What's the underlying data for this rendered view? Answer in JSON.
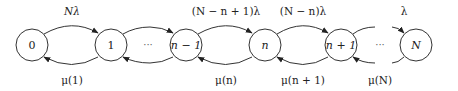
{
  "diagram": {
    "type": "birth-death state transition diagram",
    "nodes": [
      {
        "id": "0",
        "label": "0",
        "cx": 32,
        "italic": false
      },
      {
        "id": "1",
        "label": "1",
        "cx": 111,
        "italic": false
      },
      {
        "id": "n-1",
        "label": "n − 1",
        "cx": 186,
        "italic": true
      },
      {
        "id": "n",
        "label": "n",
        "cx": 265,
        "italic": true
      },
      {
        "id": "n+1",
        "label": "n + 1",
        "cx": 341,
        "italic": true
      },
      {
        "id": "N",
        "label": "N",
        "cx": 416,
        "italic": true
      }
    ],
    "ellipses": [
      {
        "text": "···",
        "x": 148
      },
      {
        "text": "···",
        "x": 380
      }
    ],
    "forward_labels": [
      {
        "text": "Nλ",
        "x": 72
      },
      {
        "text": "(N − n + 1)λ",
        "x": 226
      },
      {
        "text": "(N − n)λ",
        "x": 303
      },
      {
        "text": "λ",
        "x": 404
      }
    ],
    "backward_labels": [
      {
        "text": "μ(1)",
        "x": 72
      },
      {
        "text": "μ(n)",
        "x": 226
      },
      {
        "text": "μ(n + 1)",
        "x": 303
      },
      {
        "text": "μ(N)",
        "x": 380
      }
    ],
    "colors": {
      "stroke": "#333333",
      "text": "#222222",
      "background": "#ffffff"
    }
  }
}
